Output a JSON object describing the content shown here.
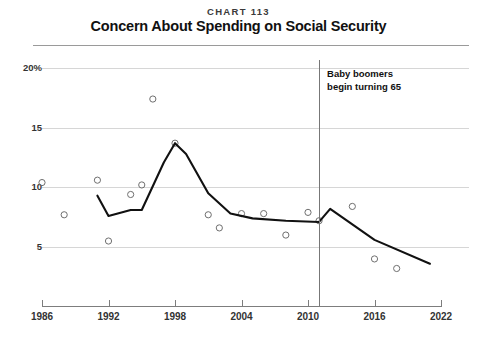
{
  "header": {
    "chart_number": "CHART 113",
    "title": "Concern About Spending on Social Security"
  },
  "annotation": {
    "text": "Baby boomers\nbegin turning 65",
    "year": 2011
  },
  "chart_data": {
    "type": "line",
    "title": "Concern About Spending on Social Security",
    "subtitle": "CHART 113",
    "xlabel": "",
    "ylabel": "",
    "xlim": [
      1985,
      2022.5
    ],
    "ylim": [
      0,
      20
    ],
    "grid": true,
    "legend": false,
    "y_ticks": [
      20,
      15,
      10,
      5
    ],
    "y_tick_labels": [
      "20%",
      "15",
      "10",
      "5"
    ],
    "x_ticks": [
      1986,
      1992,
      1998,
      2004,
      2010,
      2016,
      2022
    ],
    "x_tick_labels": [
      "1986",
      "1992",
      "1998",
      "2004",
      "2010",
      "2016",
      "2022"
    ],
    "series": [
      {
        "name": "Annual survey readings",
        "type": "scatter",
        "marker": "open-circle",
        "points": [
          {
            "x": 1986,
            "y": 10.4
          },
          {
            "x": 1988,
            "y": 7.7
          },
          {
            "x": 1991,
            "y": 10.6
          },
          {
            "x": 1992,
            "y": 5.5
          },
          {
            "x": 1994,
            "y": 9.4
          },
          {
            "x": 1995,
            "y": 10.2
          },
          {
            "x": 1996,
            "y": 17.4
          },
          {
            "x": 1998,
            "y": 13.7
          },
          {
            "x": 2001,
            "y": 7.7
          },
          {
            "x": 2002,
            "y": 6.6
          },
          {
            "x": 2004,
            "y": 7.8
          },
          {
            "x": 2006,
            "y": 7.8
          },
          {
            "x": 2008,
            "y": 6.0
          },
          {
            "x": 2010,
            "y": 7.9
          },
          {
            "x": 2011,
            "y": 7.2
          },
          {
            "x": 2014,
            "y": 8.4
          },
          {
            "x": 2016,
            "y": 4.0
          },
          {
            "x": 2018,
            "y": 3.2
          }
        ]
      },
      {
        "name": "Smoothed trend",
        "type": "line",
        "points": [
          {
            "x": 1991,
            "y": 9.3
          },
          {
            "x": 1992,
            "y": 7.6
          },
          {
            "x": 1994,
            "y": 8.1
          },
          {
            "x": 1995,
            "y": 8.1
          },
          {
            "x": 1997,
            "y": 12.1
          },
          {
            "x": 1998,
            "y": 13.7
          },
          {
            "x": 1999,
            "y": 12.8
          },
          {
            "x": 2001,
            "y": 9.5
          },
          {
            "x": 2003,
            "y": 7.8
          },
          {
            "x": 2005,
            "y": 7.4
          },
          {
            "x": 2008,
            "y": 7.2
          },
          {
            "x": 2011,
            "y": 7.1
          },
          {
            "x": 2012,
            "y": 8.2
          },
          {
            "x": 2016,
            "y": 5.6
          },
          {
            "x": 2021,
            "y": 3.6
          }
        ]
      }
    ]
  }
}
